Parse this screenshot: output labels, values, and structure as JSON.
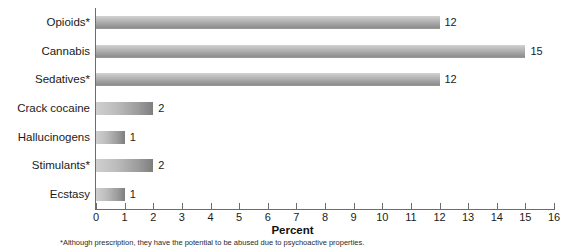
{
  "chart_data": {
    "type": "bar",
    "orientation": "horizontal",
    "title": "",
    "xlabel": "Percent",
    "ylabel": "",
    "xlim": [
      0,
      16
    ],
    "xticks": [
      0,
      1,
      2,
      3,
      4,
      5,
      6,
      7,
      8,
      9,
      10,
      11,
      12,
      13,
      14,
      15,
      16
    ],
    "xtick_labels": [
      "0",
      "1",
      "2",
      "3",
      "4",
      "5",
      "6",
      "7",
      "8",
      "9",
      "10",
      "11",
      "12",
      "13",
      "14",
      "15",
      "16"
    ],
    "grid": false,
    "legend": null,
    "categories": [
      "Opioids*",
      "Cannabis",
      "Sedatives*",
      "Crack cocaine",
      "Hallucinogens",
      "Stimulants*",
      "Ecstasy"
    ],
    "values": [
      12,
      15,
      12,
      2,
      1,
      2,
      1
    ],
    "value_labels": [
      "12",
      "15",
      "12",
      "2",
      "1",
      "2",
      "1"
    ],
    "bar_color_light": "#d2d2d2",
    "bar_color_dark": "#8f8f8f",
    "axis_color": "#6d6d6d",
    "text_color": "#1a1a1a",
    "footnote": "*Although prescription, they have the potential to be abused due to psychoactive properties."
  }
}
